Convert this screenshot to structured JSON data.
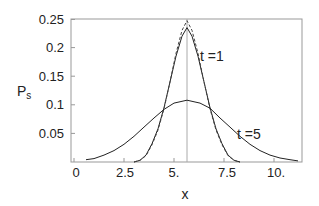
{
  "chart_data": {
    "type": "line",
    "title": "",
    "xlabel": "x",
    "ylabel": "P",
    "ylabel_subscript": "s",
    "xlim": [
      0,
      11.4
    ],
    "ylim": [
      0,
      0.25
    ],
    "x_ticks": [
      0,
      2.5,
      5,
      7.5,
      10
    ],
    "x_tick_labels": [
      "0",
      "2.5",
      "5.",
      "7.5",
      "10."
    ],
    "y_ticks": [
      0.05,
      0.1,
      0.15,
      0.2,
      0.25
    ],
    "y_tick_labels": [
      "0.05",
      "0.1",
      "0.15",
      "0.2",
      "0.25"
    ],
    "grid": false,
    "legend": null,
    "vertical_reference_line": {
      "x": 5.65,
      "color": "#aaaaaa"
    },
    "series": [
      {
        "name": "t = 1",
        "style": "solid",
        "color": "#222222",
        "x": [
          3.0,
          3.3,
          3.6,
          3.9,
          4.2,
          4.5,
          4.8,
          5.1,
          5.4,
          5.65,
          5.9,
          6.2,
          6.5,
          6.8,
          7.1,
          7.4,
          7.7,
          8.0,
          8.3
        ],
        "values": [
          0.0,
          0.003,
          0.012,
          0.032,
          0.058,
          0.095,
          0.14,
          0.185,
          0.22,
          0.235,
          0.22,
          0.185,
          0.14,
          0.095,
          0.058,
          0.032,
          0.012,
          0.003,
          0.0
        ]
      },
      {
        "name": "t = 1 (dashed reference)",
        "style": "dashed",
        "color": "#444444",
        "x": [
          3.0,
          3.3,
          3.6,
          3.9,
          4.2,
          4.5,
          4.8,
          5.1,
          5.4,
          5.65,
          5.9,
          6.2,
          6.5,
          6.8,
          7.1,
          7.4,
          7.7,
          8.0,
          8.3
        ],
        "values": [
          0.0,
          0.003,
          0.011,
          0.03,
          0.056,
          0.093,
          0.14,
          0.19,
          0.23,
          0.247,
          0.23,
          0.19,
          0.14,
          0.093,
          0.056,
          0.03,
          0.011,
          0.003,
          0.0
        ]
      },
      {
        "name": "t = 5",
        "style": "solid",
        "color": "#222222",
        "x": [
          0.6,
          1.0,
          1.5,
          2.0,
          2.5,
          3.0,
          3.5,
          4.0,
          4.5,
          5.0,
          5.65,
          6.3,
          6.8,
          7.3,
          7.8,
          8.3,
          8.8,
          9.3,
          9.8,
          10.3,
          10.8,
          11.2
        ],
        "values": [
          0.004,
          0.006,
          0.012,
          0.02,
          0.031,
          0.045,
          0.061,
          0.077,
          0.092,
          0.103,
          0.108,
          0.103,
          0.094,
          0.077,
          0.061,
          0.045,
          0.031,
          0.02,
          0.012,
          0.007,
          0.004,
          0.002
        ]
      }
    ],
    "annotations": [
      {
        "text": "t =1",
        "x": 6.5,
        "y": 0.19
      },
      {
        "text": "t =5",
        "x": 8.2,
        "y": 0.05
      }
    ]
  },
  "labels": {
    "ylabel_main": "P",
    "ylabel_sub": "s",
    "xlabel": "x",
    "annot_t1": "t =1",
    "annot_t5": "t =5",
    "xticks": [
      "0",
      "2.5",
      "5.",
      "7.5",
      "10."
    ],
    "yticks": [
      "0.25",
      "0.2",
      "0.15",
      "0.1",
      "0.05"
    ]
  }
}
